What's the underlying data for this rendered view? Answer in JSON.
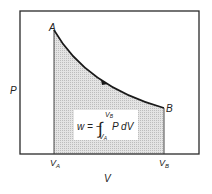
{
  "diagram": {
    "type": "pv-diagram",
    "axes": {
      "y_label": "P",
      "x_label": "V"
    },
    "points": {
      "start": "A",
      "end": "B"
    },
    "ticks": {
      "va_main": "V",
      "va_sub": "A",
      "vb_main": "V",
      "vb_sub": "B"
    },
    "formula": {
      "lhs": "w = −",
      "integral": "∫",
      "upper_main": "V",
      "upper_sub": "B",
      "lower_main": "V",
      "lower_sub": "A",
      "integrand": "P dV"
    },
    "colors": {
      "frame": "#2a2a2a",
      "curve": "#1a1a1a",
      "shade": "#d9d9d9",
      "formula_bg": "#ffffff"
    }
  }
}
